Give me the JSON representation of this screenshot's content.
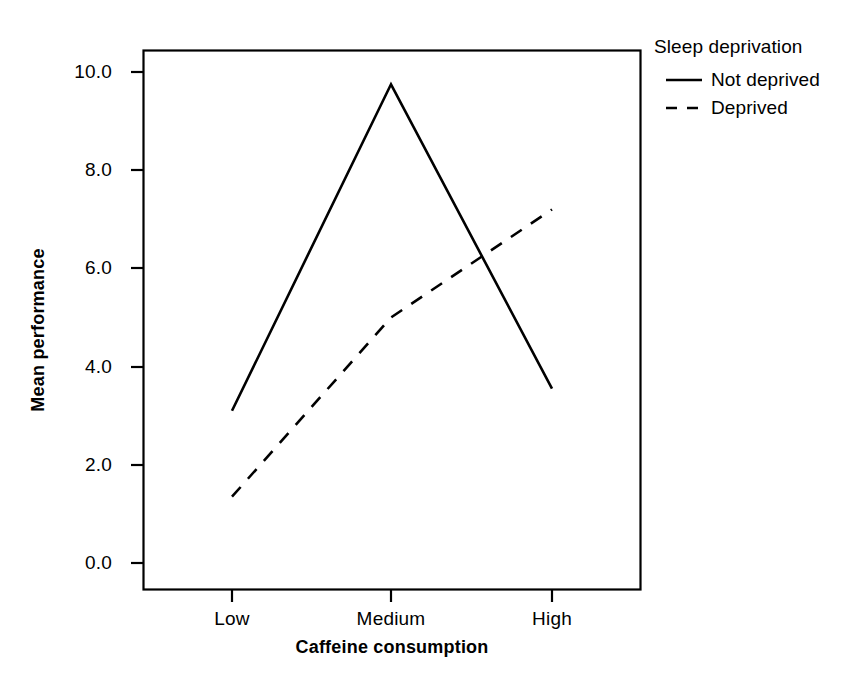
{
  "chart_data": {
    "type": "line",
    "title": "",
    "xlabel": "Caffeine consumption",
    "ylabel": "Mean performance",
    "categories": [
      "Low",
      "Medium",
      "High"
    ],
    "series": [
      {
        "name": "Not deprived",
        "values": [
          3.1,
          9.75,
          3.55
        ],
        "style": "solid"
      },
      {
        "name": "Deprived",
        "values": [
          1.35,
          5.0,
          7.2
        ],
        "style": "dashed"
      }
    ],
    "ylim": [
      0.0,
      10.0
    ],
    "yticks": [
      "0.0",
      "2.0",
      "4.0",
      "6.0",
      "8.0",
      "10.0"
    ],
    "ytick_values": [
      0.0,
      2.0,
      4.0,
      6.0,
      8.0,
      10.0
    ],
    "grid": false,
    "legend": {
      "title": "Sleep deprivation",
      "position": "right"
    }
  },
  "axes": {
    "y_title": "Mean performance",
    "x_title": "Caffeine consumption",
    "y_ticks": [
      "10.0",
      "8.0",
      "6.0",
      "4.0",
      "2.0",
      "0.0"
    ],
    "x_ticks": [
      "Low",
      "Medium",
      "High"
    ]
  },
  "legend": {
    "title": "Sleep deprivation",
    "entries": [
      {
        "label": "Not deprived",
        "swatch": "solid-line-icon"
      },
      {
        "label": "Deprived",
        "swatch": "dashed-line-icon"
      }
    ]
  },
  "colors": {
    "line": "#000000",
    "axis": "#000000",
    "background": "#ffffff"
  }
}
